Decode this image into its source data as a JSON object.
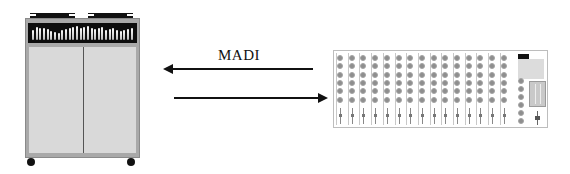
{
  "diagram": {
    "link_label": "MADI",
    "arrows": [
      {
        "direction": "left",
        "from": "mixer",
        "to": "cabinet"
      },
      {
        "direction": "right",
        "from": "cabinet",
        "to": "mixer"
      }
    ],
    "devices": {
      "cabinet": {
        "name": "rack-cabinet",
        "doors": 2,
        "wheels": 2,
        "meter_bars": 28
      },
      "mixer": {
        "name": "mixing-console",
        "channels": 15,
        "knobs_per_channel": 6,
        "master_knobs": 6
      }
    },
    "colors": {
      "background": "#ffffff",
      "cabinet_frame": "#a9a9a9",
      "cabinet_door": "#d9d9d9",
      "meter_panel": "#0d0d0d",
      "knob": "#8e8e8e",
      "arrow": "#111111"
    }
  }
}
